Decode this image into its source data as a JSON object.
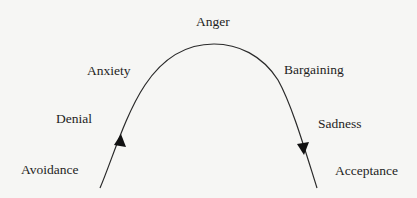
{
  "diagram": {
    "type": "change-curve",
    "stages": [
      {
        "id": "avoidance",
        "label": "Avoidance"
      },
      {
        "id": "denial",
        "label": "Denial"
      },
      {
        "id": "anxiety",
        "label": "Anxiety"
      },
      {
        "id": "anger",
        "label": "Anger"
      },
      {
        "id": "bargaining",
        "label": "Bargaining"
      },
      {
        "id": "sadness",
        "label": "Sadness"
      },
      {
        "id": "acceptance",
        "label": "Acceptance"
      }
    ],
    "arrows": [
      {
        "id": "rising-arrow",
        "direction": "up"
      },
      {
        "id": "falling-arrow",
        "direction": "down"
      }
    ],
    "colors": {
      "background": "#f6f6f4",
      "line": "#2a2a2a",
      "text": "#1e1e1e"
    }
  }
}
